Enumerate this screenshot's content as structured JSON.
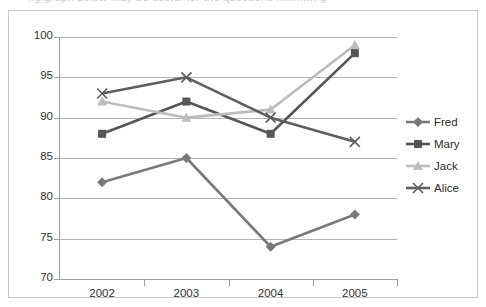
{
  "top_partial_text": "ng graph below may be useful for the questions ............ g",
  "chart_data": {
    "type": "line",
    "title": "",
    "subtitle": "",
    "xlabel": "",
    "ylabel": "",
    "categories": [
      "2002",
      "2003",
      "2004",
      "2005"
    ],
    "ylim": [
      70,
      100
    ],
    "yticks": [
      70,
      75,
      80,
      85,
      90,
      95,
      100
    ],
    "ytick_labels": [
      "70",
      "75",
      "80",
      "85",
      "90",
      "95",
      "100"
    ],
    "grid": "horizontal",
    "legend_position": "right",
    "series": [
      {
        "name": "Fred",
        "marker": "diamond",
        "color": "#7a7a7a",
        "values": [
          82,
          85,
          74,
          78
        ]
      },
      {
        "name": "Mary",
        "marker": "square",
        "color": "#565656",
        "values": [
          88,
          92,
          88,
          98
        ]
      },
      {
        "name": "Jack",
        "marker": "triangle",
        "color": "#bdbdbd",
        "values": [
          92,
          90,
          91,
          99
        ]
      },
      {
        "name": "Alice",
        "marker": "cross",
        "color": "#5e5e5e",
        "values": [
          93,
          95,
          90,
          87
        ]
      }
    ]
  },
  "legend": {
    "items": [
      {
        "label": "Fred"
      },
      {
        "label": "Mary"
      },
      {
        "label": "Jack"
      },
      {
        "label": "Alice"
      }
    ]
  },
  "colors": {
    "frame_border": "#c8c8c8",
    "gridline": "#b3b3b3",
    "axis": "#9e9e9e",
    "tick_text": "#333333",
    "legend_text": "#2b2b2b",
    "background": "#ffffff"
  }
}
